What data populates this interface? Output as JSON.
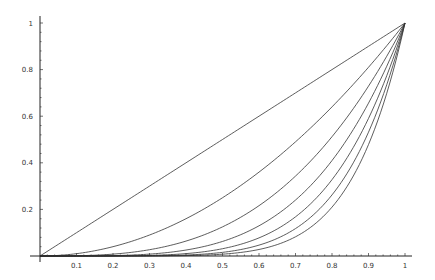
{
  "chart_data": {
    "type": "line",
    "title": "",
    "xlabel": "",
    "ylabel": "",
    "xlim": [
      0,
      1
    ],
    "ylim": [
      0,
      1
    ],
    "grid": false,
    "legend": null,
    "x_ticks": [
      "0.1",
      "0.2",
      "0.3",
      "0.4",
      "0.5",
      "0.6",
      "0.7",
      "0.8",
      "0.9",
      "1"
    ],
    "x_tick_values": [
      0.1,
      0.2,
      0.3,
      0.4,
      0.5,
      0.6,
      0.7,
      0.8,
      0.9,
      1
    ],
    "y_ticks": [
      "0.2",
      "0.4",
      "0.6",
      "0.8",
      "1"
    ],
    "y_tick_values": [
      0.2,
      0.4,
      0.6,
      0.8,
      1
    ],
    "x": [
      0,
      0.1,
      0.2,
      0.3,
      0.4,
      0.5,
      0.6,
      0.7,
      0.8,
      0.9,
      1
    ],
    "series": [
      {
        "name": "x^1",
        "exponent": 1,
        "values": [
          0,
          0.1,
          0.2,
          0.3,
          0.4,
          0.5,
          0.6,
          0.7,
          0.8,
          0.9,
          1
        ]
      },
      {
        "name": "x^2",
        "exponent": 2,
        "values": [
          0,
          0.01,
          0.04,
          0.09,
          0.16,
          0.25,
          0.36,
          0.49,
          0.64,
          0.81,
          1
        ]
      },
      {
        "name": "x^3",
        "exponent": 3,
        "values": [
          0,
          0.001,
          0.008,
          0.027,
          0.064,
          0.125,
          0.216,
          0.343,
          0.512,
          0.729,
          1
        ]
      },
      {
        "name": "x^4",
        "exponent": 4,
        "values": [
          0,
          0.0001,
          0.0016,
          0.0081,
          0.0256,
          0.0625,
          0.1296,
          0.2401,
          0.4096,
          0.6561,
          1
        ]
      },
      {
        "name": "x^5",
        "exponent": 5,
        "values": [
          0,
          1e-05,
          0.00032,
          0.00243,
          0.01024,
          0.03125,
          0.07776,
          0.16807,
          0.32768,
          0.59049,
          1
        ]
      },
      {
        "name": "x^6",
        "exponent": 6,
        "values": [
          0,
          1e-06,
          6.4e-05,
          0.000729,
          0.004096,
          0.015625,
          0.046656,
          0.117649,
          0.262144,
          0.531441,
          1
        ]
      },
      {
        "name": "x^7",
        "exponent": 7,
        "values": [
          0,
          1e-07,
          1.28e-05,
          0.0002187,
          0.0016384,
          0.0078125,
          0.0279936,
          0.0823543,
          0.2097152,
          0.4782969,
          1
        ]
      }
    ]
  },
  "style": {
    "line_color": "#333333",
    "axis_color": "#222222",
    "background": "#ffffff"
  }
}
